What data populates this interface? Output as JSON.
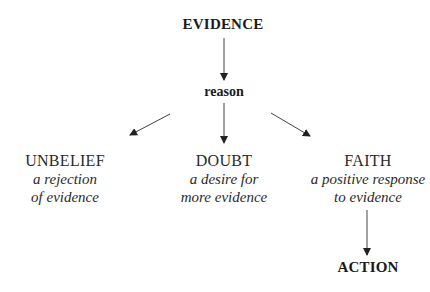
{
  "diagram": {
    "top": "EVIDENCE",
    "middle": "reason",
    "outcomes": [
      {
        "title": "UNBELIEF",
        "description": [
          "a rejection",
          "of evidence"
        ]
      },
      {
        "title": "DOUBT",
        "description": [
          "a desire for",
          "more evidence"
        ]
      },
      {
        "title": "FAITH",
        "description": [
          "a positive response",
          "to evidence"
        ]
      }
    ],
    "result": "ACTION",
    "colors": {
      "text": "#1a1a1a",
      "arrow": "#333333"
    }
  }
}
